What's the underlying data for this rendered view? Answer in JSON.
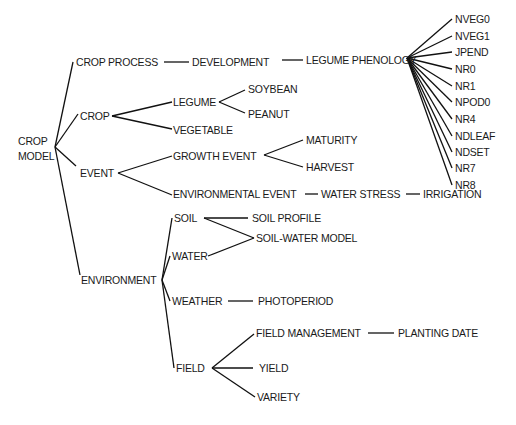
{
  "diagram": {
    "type": "tree",
    "root": "CROP MODEL",
    "nodes": {
      "root": {
        "label_line1": "CROP",
        "label_line2": "MODEL"
      },
      "crop_process": "CROP PROCESS",
      "development": "DEVELOPMENT",
      "legume_phenology": "LEGUME PHENOLOGY",
      "phenology_stages": [
        "NVEG0",
        "NVEG1",
        "JPEND",
        "NR0",
        "NR1",
        "NPOD0",
        "NR4",
        "NDLEAF",
        "NDSET",
        "NR7",
        "NR8"
      ],
      "crop": "CROP",
      "legume": "LEGUME",
      "soybean": "SOYBEAN",
      "peanut": "PEANUT",
      "vegetable": "VEGETABLE",
      "event": "EVENT",
      "growth_event": "GROWTH EVENT",
      "maturity": "MATURITY",
      "harvest": "HARVEST",
      "environmental_event": "ENVIRONMENTAL EVENT",
      "water_stress": "WATER STRESS",
      "irrigation": "IRRIGATION",
      "environment": "ENVIRONMENT",
      "soil": "SOIL",
      "soil_profile": "SOIL PROFILE",
      "soil_water_model": "SOIL-WATER MODEL",
      "water": "WATER",
      "weather": "WEATHER",
      "photoperiod": "PHOTOPERIOD",
      "field": "FIELD",
      "field_management": "FIELD MANAGEMENT",
      "planting_date": "PLANTING DATE",
      "yield": "YIELD",
      "variety": "VARIETY"
    },
    "edges": [
      [
        "CROP MODEL",
        "CROP PROCESS"
      ],
      [
        "CROP MODEL",
        "CROP"
      ],
      [
        "CROP MODEL",
        "EVENT"
      ],
      [
        "CROP MODEL",
        "ENVIRONMENT"
      ],
      [
        "CROP PROCESS",
        "DEVELOPMENT"
      ],
      [
        "DEVELOPMENT",
        "LEGUME PHENOLOGY"
      ],
      [
        "LEGUME PHENOLOGY",
        "NVEG0"
      ],
      [
        "LEGUME PHENOLOGY",
        "NVEG1"
      ],
      [
        "LEGUME PHENOLOGY",
        "JPEND"
      ],
      [
        "LEGUME PHENOLOGY",
        "NR0"
      ],
      [
        "LEGUME PHENOLOGY",
        "NR1"
      ],
      [
        "LEGUME PHENOLOGY",
        "NPOD0"
      ],
      [
        "LEGUME PHENOLOGY",
        "NR4"
      ],
      [
        "LEGUME PHENOLOGY",
        "NDLEAF"
      ],
      [
        "LEGUME PHENOLOGY",
        "NDSET"
      ],
      [
        "LEGUME PHENOLOGY",
        "NR7"
      ],
      [
        "LEGUME PHENOLOGY",
        "NR8"
      ],
      [
        "CROP",
        "LEGUME"
      ],
      [
        "CROP",
        "VEGETABLE"
      ],
      [
        "LEGUME",
        "SOYBEAN"
      ],
      [
        "LEGUME",
        "PEANUT"
      ],
      [
        "EVENT",
        "GROWTH EVENT"
      ],
      [
        "EVENT",
        "ENVIRONMENTAL EVENT"
      ],
      [
        "GROWTH EVENT",
        "MATURITY"
      ],
      [
        "GROWTH EVENT",
        "HARVEST"
      ],
      [
        "ENVIRONMENTAL EVENT",
        "WATER STRESS"
      ],
      [
        "WATER STRESS",
        "IRRIGATION"
      ],
      [
        "ENVIRONMENT",
        "SOIL"
      ],
      [
        "ENVIRONMENT",
        "WATER"
      ],
      [
        "ENVIRONMENT",
        "WEATHER"
      ],
      [
        "ENVIRONMENT",
        "FIELD"
      ],
      [
        "SOIL",
        "SOIL PROFILE"
      ],
      [
        "SOIL",
        "SOIL-WATER MODEL"
      ],
      [
        "WATER",
        "SOIL-WATER MODEL"
      ],
      [
        "WEATHER",
        "PHOTOPERIOD"
      ],
      [
        "FIELD",
        "FIELD MANAGEMENT"
      ],
      [
        "FIELD",
        "YIELD"
      ],
      [
        "FIELD",
        "VARIETY"
      ],
      [
        "FIELD MANAGEMENT",
        "PLANTING DATE"
      ]
    ]
  }
}
